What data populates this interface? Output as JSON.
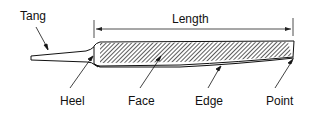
{
  "diagram": {
    "labels": {
      "tang": "Tang",
      "length": "Length",
      "heel": "Heel",
      "face": "Face",
      "edge": "Edge",
      "point": "Point"
    }
  }
}
